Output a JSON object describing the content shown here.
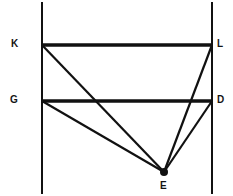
{
  "figure": {
    "type": "geometry-diagram",
    "width": 233,
    "height": 196,
    "background_color": "#ffffff",
    "stroke_color": "#111111",
    "label_color": "#141414"
  },
  "vertices": [
    {
      "id": "K",
      "label": "K",
      "x": 42,
      "y": 45,
      "label_x": 11,
      "label_y": 39
    },
    {
      "id": "L",
      "label": "L",
      "x": 212,
      "y": 45,
      "label_x": 217,
      "label_y": 39
    },
    {
      "id": "G",
      "label": "G",
      "x": 42,
      "y": 101,
      "label_x": 10,
      "label_y": 95
    },
    {
      "id": "D",
      "label": "D",
      "x": 212,
      "y": 101,
      "label_x": 217,
      "label_y": 95
    },
    {
      "id": "E",
      "label": "E",
      "x": 164,
      "y": 172,
      "label_x": 160,
      "label_y": 181
    }
  ],
  "lines": {
    "vertical_left": {
      "name": "left-vertical-line",
      "x1": 42,
      "y1": 2,
      "x2": 42,
      "y2": 194,
      "width": 2
    },
    "vertical_right": {
      "name": "right-vertical-line",
      "x1": 212,
      "y1": 2,
      "x2": 212,
      "y2": 194,
      "width": 2
    },
    "segment_KL": {
      "name": "segment-kl",
      "x1": 42,
      "y1": 45,
      "x2": 212,
      "y2": 45,
      "width": 3.4
    },
    "segment_GD": {
      "name": "segment-gd",
      "x1": 42,
      "y1": 101,
      "x2": 212,
      "y2": 101,
      "width": 3.4
    },
    "segment_KE": {
      "name": "segment-ke",
      "x1": 42,
      "y1": 45,
      "x2": 164,
      "y2": 172,
      "width": 2.2
    },
    "segment_GE": {
      "name": "segment-ge",
      "x1": 42,
      "y1": 101,
      "x2": 164,
      "y2": 172,
      "width": 2.2
    },
    "segment_LE": {
      "name": "segment-le",
      "x1": 212,
      "y1": 45,
      "x2": 164,
      "y2": 172,
      "width": 2.2
    },
    "segment_DE": {
      "name": "segment-de",
      "x1": 212,
      "y1": 101,
      "x2": 164,
      "y2": 172,
      "width": 2.2
    }
  },
  "point_marker": {
    "name": "point-e-dot",
    "cx": 164,
    "cy": 172,
    "r": 4
  }
}
